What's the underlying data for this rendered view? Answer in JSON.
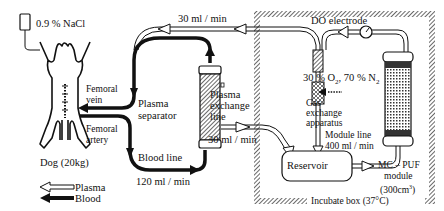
{
  "diagram": {
    "type": "flow-schematic"
  },
  "labels": {
    "saline": "0.9 % NaCl",
    "femoral_vein_1": "Femoral",
    "femoral_vein_2": "vein",
    "femoral_artery_1": "Femoral",
    "femoral_artery_2": "artery",
    "dog": "Dog (20kg)",
    "plasma_separator_1": "Plasma",
    "plasma_separator_2": "separator",
    "blood_line": "Blood line",
    "blood_flow": "120 ml / min",
    "top_flow": "30 ml / min",
    "plasma_exchange_1": "Plasma",
    "plasma_exchange_2": "exchange",
    "plasma_exchange_3": "line",
    "exchange_flow": "30 ml / min",
    "do_electrode": "DO electrode",
    "gas_mix_a": "30 % O",
    "gas_mix_sub1": "2",
    "gas_mix_b": ", 70 % N",
    "gas_mix_sub2": "2",
    "gas_exchange_1": "Gas",
    "gas_exchange_2": "exchange",
    "gas_exchange_3": "apparatus",
    "module_line_1": "Module line",
    "module_line_2": "400 ml / min",
    "reservoir": "Reservoir",
    "mcpuf_1": "MC – PUF",
    "mcpuf_2": "module",
    "mcpuf_3a": "(300cm",
    "mcpuf_3sup": "3",
    "mcpuf_3b": ")",
    "incubate_box": "Incubate box (37°C)"
  },
  "legend": [
    {
      "key": "plasma",
      "label": "Plasma",
      "style": "hollow-arrow"
    },
    {
      "key": "blood",
      "label": "Blood",
      "style": "solid-arrow"
    }
  ],
  "colors": {
    "line": "#111111",
    "background": "#ffffff",
    "hatch": "#555555"
  }
}
